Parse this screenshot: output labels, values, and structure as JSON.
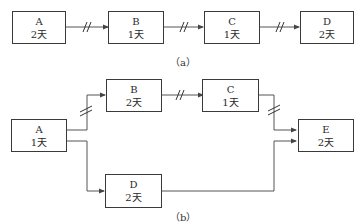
{
  "diagram_a": {
    "caption": "（a）",
    "nodes": [
      {
        "id": "A",
        "name": "A",
        "duration": "2天"
      },
      {
        "id": "B",
        "name": "B",
        "duration": "1天"
      },
      {
        "id": "C",
        "name": "C",
        "duration": "1天"
      },
      {
        "id": "D",
        "name": "D",
        "duration": "2天"
      }
    ],
    "edges": [
      {
        "from": "A",
        "to": "B",
        "break_mark": true
      },
      {
        "from": "B",
        "to": "C",
        "break_mark": true
      },
      {
        "from": "C",
        "to": "D",
        "break_mark": true
      }
    ]
  },
  "diagram_b": {
    "caption": "（b）",
    "nodes": [
      {
        "id": "A",
        "name": "A",
        "duration": "1天"
      },
      {
        "id": "B",
        "name": "B",
        "duration": "2天"
      },
      {
        "id": "C",
        "name": "C",
        "duration": "1天"
      },
      {
        "id": "D",
        "name": "D",
        "duration": "2天"
      },
      {
        "id": "E",
        "name": "E",
        "duration": "2天"
      }
    ],
    "edges": [
      {
        "from": "A",
        "to": "B",
        "break_mark": true
      },
      {
        "from": "A",
        "to": "D",
        "break_mark": false
      },
      {
        "from": "B",
        "to": "C",
        "break_mark": true
      },
      {
        "from": "C",
        "to": "E",
        "break_mark": true
      },
      {
        "from": "D",
        "to": "E",
        "break_mark": false
      }
    ]
  },
  "colors": {
    "line": "#555555",
    "box_border": "#3a3a3a"
  }
}
